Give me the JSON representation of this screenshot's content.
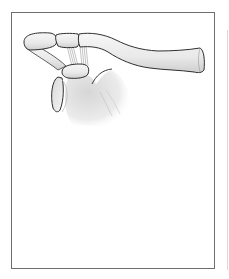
{
  "figure": {
    "parts": [
      "clavicle",
      "acromion",
      "coracoid-process",
      "coracoclavicular-ligaments",
      "scapula",
      "glenoid"
    ],
    "colors": {
      "frame_border": "#6e6e6e",
      "bone_outline": "#3a3a3a",
      "bone_fill": "#efefef",
      "shading": "#cfcfcf",
      "background": "#ffffff"
    }
  }
}
